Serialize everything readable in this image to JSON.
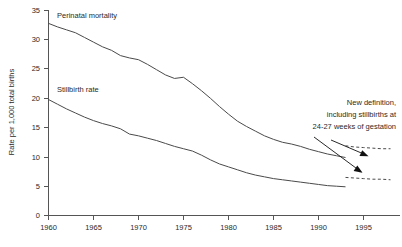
{
  "chart_data": {
    "type": "line",
    "title": "",
    "xlabel": "",
    "ylabel": "Rate per 1,000 total births",
    "xlim": [
      1960,
      1998
    ],
    "ylim": [
      0,
      35
    ],
    "grid": false,
    "legend_position": "inline-labels",
    "x_ticks": [
      "1960",
      "1965",
      "1970",
      "1975",
      "1980",
      "1985",
      "1990",
      "1995"
    ],
    "x_tick_values": [
      1960,
      1965,
      1970,
      1975,
      1980,
      1985,
      1990,
      1995
    ],
    "y_ticks": [
      "0",
      "5",
      "10",
      "15",
      "20",
      "25",
      "30",
      "35"
    ],
    "y_tick_values": [
      0,
      5,
      10,
      15,
      20,
      25,
      30,
      35
    ],
    "x": [
      1960,
      1961,
      1962,
      1963,
      1964,
      1965,
      1966,
      1967,
      1968,
      1969,
      1970,
      1971,
      1972,
      1973,
      1974,
      1975,
      1976,
      1977,
      1978,
      1979,
      1980,
      1981,
      1982,
      1983,
      1984,
      1985,
      1986,
      1987,
      1988,
      1989,
      1990,
      1991,
      1992,
      1993
    ],
    "series": [
      {
        "name": "Perinatal mortality",
        "style": "solid",
        "label_position": "top-left",
        "values": [
          32.8,
          32.2,
          31.7,
          31.2,
          30.4,
          29.6,
          28.8,
          28.2,
          27.3,
          26.9,
          26.6,
          25.8,
          24.9,
          24.0,
          23.4,
          23.6,
          22.5,
          21.3,
          20.0,
          18.6,
          17.3,
          16.1,
          15.2,
          14.4,
          13.6,
          13.0,
          12.5,
          12.2,
          11.8,
          11.3,
          10.9,
          10.5,
          10.2,
          9.9
        ]
      },
      {
        "name": "Stillbirth rate",
        "style": "solid",
        "label_position": "mid-left",
        "values": [
          19.8,
          19.0,
          18.2,
          17.5,
          16.8,
          16.2,
          15.7,
          15.3,
          14.8,
          13.9,
          13.6,
          13.2,
          12.8,
          12.3,
          11.8,
          11.4,
          11.0,
          10.3,
          9.5,
          8.8,
          8.3,
          7.8,
          7.3,
          6.9,
          6.6,
          6.3,
          6.1,
          5.9,
          5.7,
          5.5,
          5.3,
          5.1,
          5.0,
          4.9
        ]
      }
    ],
    "dashed_segments": [
      {
        "name": "Perinatal mortality, new definition",
        "style": "dashed",
        "x": [
          1993,
          1994,
          1995,
          1996,
          1997,
          1998
        ],
        "values": [
          11.9,
          11.7,
          11.6,
          11.5,
          11.4,
          11.4
        ]
      },
      {
        "name": "Stillbirth rate, new definition",
        "style": "dashed",
        "x": [
          1993,
          1994,
          1995,
          1996,
          1997,
          1998
        ],
        "values": [
          6.5,
          6.4,
          6.3,
          6.2,
          6.2,
          6.1
        ]
      }
    ],
    "annotations": [
      {
        "name": "new-definition-note",
        "lines": [
          "New definition,",
          "including stillbirths at",
          "24-27 weeks of gestation"
        ],
        "text": "New definition, including stillbirths at 24-27 weeks of gestation",
        "arrows": 2
      }
    ],
    "colors": {
      "line": "#4a4a4a",
      "axis": "#555555",
      "text": "#2a2a2a",
      "background": "#ffffff"
    }
  }
}
